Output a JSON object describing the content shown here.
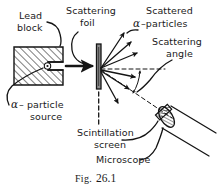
{
  "figure": {
    "caption_prefix": "Fig.",
    "caption_number": "26.1"
  },
  "labels": {
    "lead_block_line1": "Lead",
    "lead_block_line2": "block",
    "scattering_foil_line1": "Scattering",
    "scattering_foil_line2": "foil",
    "scattered_particles_line1": "Scattered",
    "scattered_particles_alpha": "α",
    "scattered_particles_line2": "–particles",
    "scattering_angle_line1": "Scattering",
    "scattering_angle_line2": "angle",
    "alpha_source_alpha": "α",
    "alpha_source_line1": "– particle",
    "alpha_source_line2": "source",
    "scintillation_line1": "Scintillation",
    "scintillation_line2": "screen",
    "microscope": "Microscope"
  },
  "colors": {
    "ink": "#141414",
    "background": "#ffffff",
    "foil_fill": "#8c8c8c",
    "hatch": "#141414"
  }
}
